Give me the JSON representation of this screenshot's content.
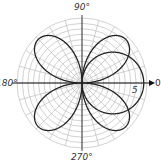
{
  "chart_data": {
    "type": "line",
    "coordinate_system": "polar",
    "title": "",
    "angle_labels": [
      "90°",
      "180°",
      "270°",
      "0"
    ],
    "radius_label": "5",
    "grid": {
      "on": true,
      "ring_step": 0.5,
      "max_radius": 6,
      "spoke_step_deg": 15
    },
    "series": [
      {
        "name": "four-petal rose",
        "equation": "r = 6 sin 2θ",
        "amplitude": 5.7,
        "petals": 4,
        "petal_angles_deg": [
          45,
          135,
          225,
          315
        ]
      },
      {
        "name": "circle",
        "equation": "r = 6 cos θ",
        "amplitude": 5.7
      }
    ],
    "colors": {
      "curve": "#222222",
      "grid": "#bdbdbd",
      "axis": "#111111"
    }
  },
  "labels": {
    "top": "90°",
    "left": "180°",
    "bottom": "270°",
    "right": "0",
    "radius_tick": "5"
  }
}
